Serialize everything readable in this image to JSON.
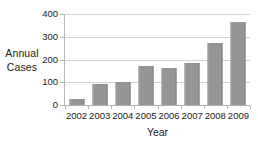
{
  "chart_data": {
    "type": "bar",
    "title": "",
    "xlabel": "Year",
    "ylabel": "Annual Cases",
    "ylabel_lines": [
      "Annual",
      "Cases"
    ],
    "categories": [
      "2002",
      "2003",
      "2004",
      "2005",
      "2006",
      "2007",
      "2008",
      "2009"
    ],
    "values": [
      25,
      92,
      103,
      170,
      162,
      184,
      272,
      366
    ],
    "ylim": [
      0,
      400
    ],
    "yticks": [
      0,
      100,
      200,
      300,
      400
    ],
    "ytick_labels": [
      "0",
      "100",
      "200",
      "300",
      "400"
    ],
    "grid": true,
    "grid_axis": "y",
    "legend": false,
    "legend_position": "none",
    "bar_color": "#959595",
    "gridline_color": "#d2d2d2",
    "axis_color": "#b0b0b0",
    "text_color": "#1a1a1a",
    "background": "#ffffff"
  }
}
